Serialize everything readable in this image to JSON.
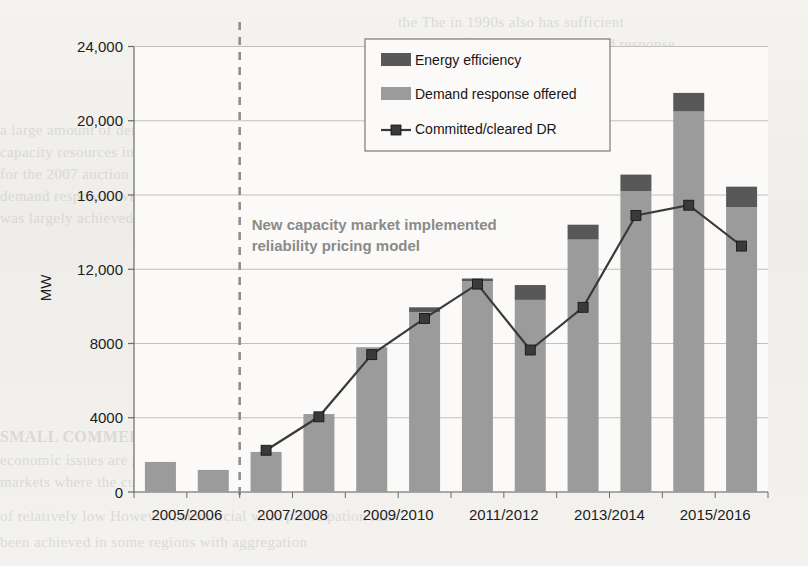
{
  "page": {
    "background_color": "#f2f1ee",
    "ghost_text": [
      {
        "t": "the  The  in  1990s  also  has  sufficient",
        "x": 398,
        "y": 14,
        "bold": false
      },
      {
        "t": "were  significantly  higher  Demand  response",
        "x": 398,
        "y": 36,
        "bold": false
      },
      {
        "t": "ment  The  current  market  design  capacity",
        "x": 398,
        "y": 58,
        "bold": false
      },
      {
        "t": "interest - by  resource  in  all  zones  offered",
        "x": 398,
        "y": 80,
        "bold": false
      },
      {
        "t": "It  became  possible  for  demand  response",
        "x": 398,
        "y": 100,
        "bold": false
      },
      {
        "t": "a  large  amount  of  demand  response  to  be",
        "x": 0,
        "y": 122,
        "bold": false
      },
      {
        "t": "capacity  resources  in  the  market  clearly",
        "x": 0,
        "y": 144,
        "bold": false
      },
      {
        "t": "for  the  2007  auction  development  and  the  result  of  a  decrease",
        "x": 0,
        "y": 166,
        "bold": false
      },
      {
        "t": "demand  response  overall  within  a  competitive",
        "x": 0,
        "y": 188,
        "bold": false
      },
      {
        "t": "was  largely  achieved  the  demand  response  in  capacity  market",
        "x": 0,
        "y": 210,
        "bold": false
      },
      {
        "t": "SMALL  COMMERCIAL  MARKET",
        "x": 0,
        "y": 428,
        "bold": true
      },
      {
        "t": "economic  issues  are  particularly  important  in  the  small  commercial",
        "x": 0,
        "y": 452,
        "bold": false
      },
      {
        "t": "markets  where  the  customers  are  many  and  the  demand",
        "x": 0,
        "y": 474,
        "bold": false
      },
      {
        "t": "of  relatively  low  However  commercial  wide  participation  has",
        "x": 0,
        "y": 508,
        "bold": false
      },
      {
        "t": "been  achieved  in  some  regions  with  aggregation",
        "x": 0,
        "y": 534,
        "bold": false
      }
    ]
  },
  "chart_data": {
    "type": "bar",
    "title": "",
    "xlabel": "",
    "ylabel": "MW",
    "ylim": [
      0,
      24000
    ],
    "yticks": [
      0,
      4000,
      8000,
      12000,
      16000,
      20000,
      24000
    ],
    "ytick_labels": [
      "0",
      "4000",
      "8000",
      "12,000",
      "16,000",
      "20,000",
      "24,000"
    ],
    "grid": true,
    "legend_position": "top-right",
    "categories": [
      "2005/2006",
      "2006/2007",
      "2007/2008",
      "2008/2009",
      "2009/2010",
      "2010/2011",
      "2011/2012",
      "2012/2013",
      "2013/2014",
      "2014/2015",
      "2015/2016",
      "2016/2017"
    ],
    "xtick_labels": [
      "2005/2006",
      "2007/2008",
      "2009/2010",
      "2011/2012",
      "2013/2014",
      "2015/2016"
    ],
    "xtick_category_index": [
      0,
      2,
      4,
      6,
      8,
      10
    ],
    "series": [
      {
        "name": "Demand response offered",
        "type": "bar-stack",
        "color": "#9b9b9b",
        "values": [
          1620,
          1190,
          2160,
          4200,
          7800,
          9700,
          11350,
          10350,
          13600,
          16200,
          20500,
          15350
        ]
      },
      {
        "name": "Energy efficiency",
        "type": "bar-stack",
        "color": "#585858",
        "values": [
          0,
          0,
          0,
          0,
          0,
          250,
          150,
          800,
          800,
          900,
          1000,
          1100
        ]
      },
      {
        "name": "Committed/cleared DR",
        "type": "line",
        "color": "#3a3a3a",
        "marker": "square",
        "values": [
          null,
          null,
          2250,
          4050,
          7400,
          9350,
          11200,
          7650,
          9950,
          14900,
          15450,
          13250
        ]
      }
    ],
    "annotation": {
      "text_line1": "New capacity market implemented",
      "text_line2": "reliability pricing model",
      "color": "#8a8a8a",
      "marker_line": {
        "category_index": 2,
        "style": "dashed",
        "color": "#8f8f8f"
      }
    },
    "legend": [
      {
        "label": "Energy efficiency",
        "swatch": "dark-gray",
        "color": "#585858"
      },
      {
        "label": "Demand response offered",
        "swatch": "light-gray",
        "color": "#9b9b9b"
      },
      {
        "label": "Committed/cleared DR",
        "swatch": "line-marker",
        "color": "#3a3a3a"
      }
    ]
  }
}
